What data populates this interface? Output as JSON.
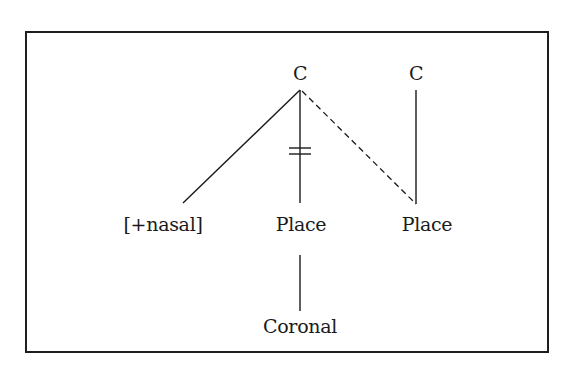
{
  "diagram": {
    "type": "autosegmental-phonology-tree",
    "nodes": {
      "c1": {
        "label": "C",
        "x": 300,
        "y": 63
      },
      "c2": {
        "label": "C",
        "x": 416,
        "y": 63
      },
      "nasal": {
        "label": "[+nasal]",
        "x": 165,
        "y": 214
      },
      "place1": {
        "label": "Place",
        "x": 301,
        "y": 214
      },
      "place2": {
        "label": "Place",
        "x": 427,
        "y": 214
      },
      "coronal": {
        "label": "Coronal",
        "x": 300,
        "y": 316
      }
    },
    "edges": [
      {
        "from": "c1",
        "to": "nasal",
        "style": "solid"
      },
      {
        "from": "c1",
        "to": "place1",
        "style": "solid",
        "delinked": true
      },
      {
        "from": "c1",
        "to": "place2",
        "style": "dashed"
      },
      {
        "from": "c2",
        "to": "place2",
        "style": "solid"
      },
      {
        "from": "place1",
        "to": "coronal",
        "style": "solid"
      }
    ],
    "colors": {
      "line": "#1a1a1a",
      "frame": "#1e1e1e",
      "background": "#ffffff"
    }
  }
}
